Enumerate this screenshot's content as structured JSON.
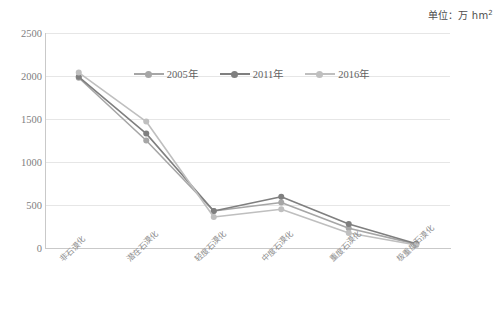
{
  "unit_caption": "单位：万 hm",
  "unit_superscript": "2",
  "legend": {
    "position": "top-center",
    "items": [
      {
        "label": "2005年",
        "color": "#a6a6a6"
      },
      {
        "label": "2011年",
        "color": "#7f7f7f"
      },
      {
        "label": "2016年",
        "color": "#bfbfbf"
      }
    ]
  },
  "axis": {
    "y_ticks": [
      "2500",
      "2000",
      "1500",
      "1000",
      "500",
      "0"
    ],
    "x_labels": [
      "非石漠化",
      "潜在石漠化",
      "轻度石漠化",
      "中度石漠化",
      "重度石漠化",
      "极重度石漠化"
    ]
  },
  "chart_data": {
    "type": "line",
    "title": "",
    "subtitle": "",
    "xlabel": "",
    "ylabel": "",
    "unit": "万 hm²",
    "ylim": [
      0,
      2500
    ],
    "ytick_step": 500,
    "grid": true,
    "legend_position": "top-center",
    "categories": [
      "非石漠化",
      "潜在石漠化",
      "轻度石漠化",
      "中度石漠化",
      "重度石漠化",
      "极重度石漠化"
    ],
    "series": [
      {
        "name": "2005年",
        "color": "#a6a6a6",
        "values": [
          1980,
          1250,
          430,
          530,
          230,
          45
        ]
      },
      {
        "name": "2011年",
        "color": "#7f7f7f",
        "values": [
          1990,
          1330,
          430,
          595,
          280,
          50
        ]
      },
      {
        "name": "2016年",
        "color": "#bfbfbf",
        "values": [
          2040,
          1470,
          360,
          450,
          175,
          35
        ]
      }
    ]
  }
}
